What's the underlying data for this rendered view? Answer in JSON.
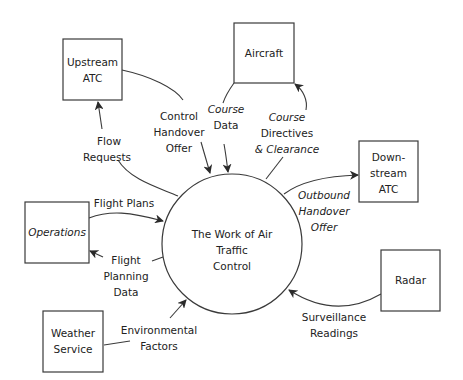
{
  "diagram": {
    "process": {
      "lines": [
        "The Work of Air",
        "Traffic",
        "Control"
      ]
    },
    "entities": [
      {
        "id": "upstream-atc",
        "lines": [
          "Upstream",
          "ATC"
        ]
      },
      {
        "id": "aircraft",
        "lines": [
          "Aircraft"
        ]
      },
      {
        "id": "downstream-atc",
        "lines": [
          "Down-",
          "stream",
          "ATC"
        ]
      },
      {
        "id": "operations",
        "lines": [
          "Operations"
        ]
      },
      {
        "id": "weather-service",
        "lines": [
          "Weather",
          "Service"
        ]
      },
      {
        "id": "radar",
        "lines": [
          "Radar"
        ]
      }
    ],
    "flows": [
      {
        "id": "flow-requests",
        "lines": [
          "Flow",
          "Requests"
        ],
        "from": "process",
        "to": "upstream-atc"
      },
      {
        "id": "control-handover-offer",
        "lines": [
          "Control",
          "Handover",
          "Offer"
        ],
        "from": "upstream-atc",
        "to": "process"
      },
      {
        "id": "course-data",
        "lines": [
          "Course",
          "Data"
        ],
        "from": "aircraft",
        "to": "process"
      },
      {
        "id": "course-directives",
        "lines": [
          "Course",
          "Directives",
          "& Clearance"
        ],
        "from": "process",
        "to": "aircraft"
      },
      {
        "id": "outbound-handover-offer",
        "lines": [
          "Outbound",
          "Handover",
          "Offer"
        ],
        "from": "process",
        "to": "downstream-atc"
      },
      {
        "id": "flight-plans",
        "lines": [
          "Flight Plans"
        ],
        "from": "operations",
        "to": "process"
      },
      {
        "id": "flight-planning-data",
        "lines": [
          "Flight",
          "Planning",
          "Data"
        ],
        "from": "process",
        "to": "operations"
      },
      {
        "id": "environmental-factors",
        "lines": [
          "Environmental",
          "Factors"
        ],
        "from": "weather-service",
        "to": "process"
      },
      {
        "id": "surveillance-readings",
        "lines": [
          "Surveillance",
          "Readings"
        ],
        "from": "radar",
        "to": "process"
      }
    ],
    "colors": {
      "stroke": "#3a3a3a",
      "text": "#222222",
      "background": "#ffffff"
    }
  }
}
